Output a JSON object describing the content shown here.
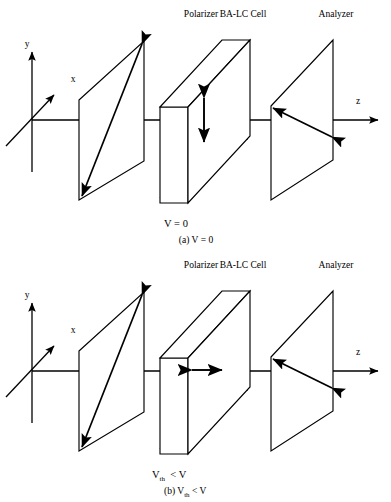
{
  "figure": {
    "stroke_color": "#000000",
    "background_color": "#ffffff"
  },
  "components": {
    "polarizer_label": "Polarizer",
    "cell_label": "BA-LC Cell",
    "analyzer_label": "Analyzer"
  },
  "axes": {
    "y_label": "y",
    "x_label": "x",
    "z_label": "z"
  },
  "panel_a": {
    "state_label": "V = 0",
    "caption_prefix": "(a)",
    "caption_value": "V = 0",
    "caption_full": "(a) V = 0",
    "director_orientation": "vertical",
    "director_description": "double-headed arrow along y inside the cell"
  },
  "panel_b": {
    "state_label_prefix": "V",
    "state_label_sub": "th",
    "state_label_suffix": "< V",
    "state_label_full": "Vth < V",
    "caption_prefix": "(b)",
    "caption_value": "Vth < V",
    "caption_full": "(b) Vth < V",
    "director_orientation": "horizontal",
    "director_description": "double-headed arrow along z inside the cell"
  },
  "geometry": {
    "axis_y_center": 120,
    "origin_x": 32,
    "polarizer_x_left": 70,
    "polarizer_x_right": 133,
    "cell_front_x": 160,
    "cell_back_x": 243,
    "analyzer_x_left": 270,
    "analyzer_x_right": 333,
    "z_arrow_tip": 380
  }
}
